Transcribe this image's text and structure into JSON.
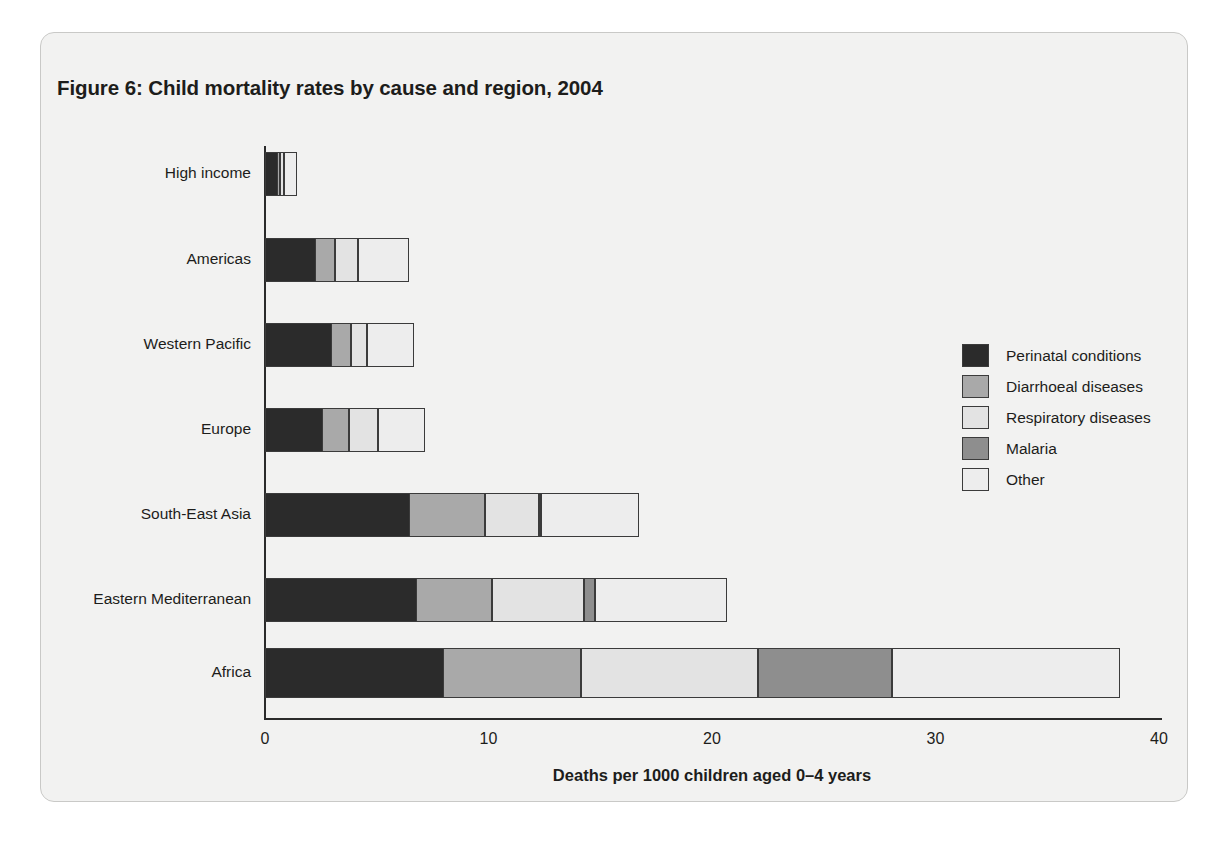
{
  "figure": {
    "title": "Figure 6: Child mortality rates by cause and region, 2004",
    "panel_bg": "#f2f2f1",
    "panel_border": "#c9c9c7"
  },
  "legend": {
    "position": "right",
    "items": [
      {
        "label": "Perinatal conditions",
        "color": "#2b2b2b"
      },
      {
        "label": "Diarrhoeal diseases",
        "color": "#a9a9a9"
      },
      {
        "label": "Respiratory diseases",
        "color": "#e3e3e3"
      },
      {
        "label": "Malaria",
        "color": "#8e8e8e"
      },
      {
        "label": "Other",
        "color": "#ededed"
      }
    ]
  },
  "chart_data": {
    "type": "bar",
    "orientation": "horizontal",
    "stacked": true,
    "title": "Figure 6: Child mortality rates by cause and region, 2004",
    "xlabel": "Deaths per 1000 children aged 0–4 years",
    "ylabel": "",
    "xlim": [
      0,
      40
    ],
    "xticks": [
      0,
      10,
      20,
      30,
      40
    ],
    "xtick_labels": [
      "0",
      "10",
      "20",
      "30",
      "40"
    ],
    "grid": false,
    "categories": [
      "High income",
      "Americas",
      "Western Pacific",
      "Europe",
      "South-East Asia",
      "Eastern Mediterranean",
      "Africa"
    ],
    "series": [
      {
        "name": "Perinatal conditions",
        "color": "#2b2b2b",
        "values": [
          0.6,
          2.3,
          3.0,
          2.6,
          6.5,
          6.8,
          8.0
        ]
      },
      {
        "name": "Diarrhoeal diseases",
        "color": "#a9a9a9",
        "values": [
          0.1,
          0.9,
          0.9,
          1.2,
          3.4,
          3.4,
          6.2
        ]
      },
      {
        "name": "Respiratory diseases",
        "color": "#e3e3e3",
        "values": [
          0.2,
          1.0,
          0.7,
          1.3,
          2.4,
          4.1,
          7.9
        ]
      },
      {
        "name": "Malaria",
        "color": "#8e8e8e",
        "values": [
          0.0,
          0.0,
          0.0,
          0.0,
          0.1,
          0.5,
          6.0
        ]
      },
      {
        "name": "Other",
        "color": "#ededed",
        "values": [
          0.6,
          2.3,
          2.1,
          2.1,
          4.4,
          5.9,
          10.2
        ]
      }
    ],
    "totals": [
      1.5,
      6.5,
      6.7,
      7.2,
      16.8,
      20.7,
      38.3
    ]
  }
}
